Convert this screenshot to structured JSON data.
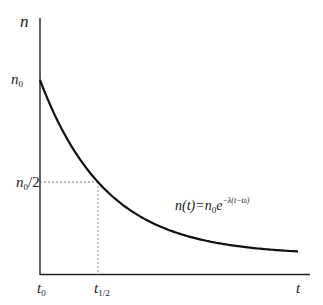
{
  "diagram": {
    "axes": {
      "y_label": "n",
      "x_label": "t"
    },
    "y_ticks": [
      {
        "base": "n",
        "sub": "0",
        "suffix": ""
      },
      {
        "base": "n",
        "sub": "0",
        "suffix": "/2"
      }
    ],
    "x_ticks": [
      {
        "base": "t",
        "sub": "0"
      },
      {
        "base": "t",
        "sub": "1/2"
      }
    ],
    "equation": {
      "lhs": "n(t)=n",
      "lhs_sub": "0",
      "base": "e",
      "exponent": "−λ(t−t",
      "exponent_sub": "0",
      "exponent_close": ")"
    },
    "colors": {
      "curve": "#111111",
      "axes": "#222222",
      "guides": "#555555"
    }
  },
  "chart_data": {
    "type": "line",
    "xlabel": "t",
    "ylabel": "n",
    "x_tick_labels": [
      "t0",
      "t1/2"
    ],
    "y_tick_labels": [
      "n0",
      "n0/2"
    ],
    "series": [
      {
        "name": "n(t)",
        "x": [
          0,
          1,
          2,
          3,
          4
        ],
        "values": [
          1.0,
          0.5,
          0.25,
          0.125,
          0.0625
        ]
      }
    ],
    "annotations": [
      "dashed guide from n0/2 to curve",
      "dashed guide from curve down to t1/2"
    ],
    "grid": false
  }
}
